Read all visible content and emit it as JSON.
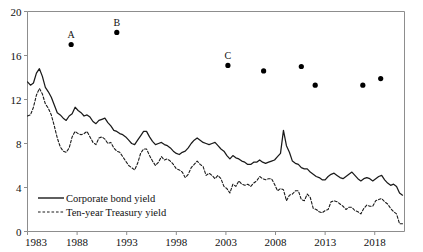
{
  "chart_data": {
    "type": "line",
    "title": "",
    "subtitle": "",
    "xlabel": "",
    "ylabel": "",
    "xlim": [
      1983,
      2021
    ],
    "ylim": [
      0,
      20
    ],
    "grid": false,
    "legend_position": "bottom-left",
    "x_ticks": [
      "1983",
      "1988",
      "1993",
      "1998",
      "2003",
      "2008",
      "2013",
      "2018"
    ],
    "x_tick_values": [
      1983,
      1988,
      1993,
      1998,
      2003,
      2008,
      2013,
      2018
    ],
    "y_ticks": [
      "0",
      "4",
      "8",
      "12",
      "16",
      "20"
    ],
    "y_tick_values": [
      0,
      4,
      8,
      12,
      16,
      20
    ],
    "legend": [
      {
        "name": "Corporate bond yield",
        "style": "solid"
      },
      {
        "name": "Ten-year Treasury yield",
        "style": "dashed"
      }
    ],
    "series": [
      {
        "name": "Corporate bond yield",
        "style": "solid",
        "x": [
          1983.0,
          1983.3,
          1983.6,
          1983.9,
          1984.2,
          1984.5,
          1984.8,
          1985.1,
          1985.4,
          1985.7,
          1986.0,
          1986.3,
          1986.6,
          1986.9,
          1987.2,
          1987.5,
          1987.8,
          1988.1,
          1988.4,
          1988.7,
          1989.0,
          1989.3,
          1989.6,
          1989.9,
          1990.2,
          1990.5,
          1990.8,
          1991.1,
          1991.4,
          1991.7,
          1992.0,
          1992.3,
          1992.6,
          1992.9,
          1993.2,
          1993.5,
          1993.8,
          1994.1,
          1994.4,
          1994.7,
          1995.0,
          1995.3,
          1995.6,
          1995.9,
          1996.2,
          1996.5,
          1996.8,
          1997.1,
          1997.4,
          1997.7,
          1998.0,
          1998.3,
          1998.6,
          1998.9,
          1999.2,
          1999.5,
          1999.8,
          2000.1,
          2000.4,
          2000.7,
          2001.0,
          2001.3,
          2001.6,
          2001.9,
          2002.2,
          2002.5,
          2002.8,
          2003.1,
          2003.4,
          2003.7,
          2004.0,
          2004.3,
          2004.6,
          2004.9,
          2005.2,
          2005.5,
          2005.8,
          2006.1,
          2006.4,
          2006.7,
          2007.0,
          2007.3,
          2007.6,
          2007.9,
          2008.2,
          2008.5,
          2008.8,
          2009.1,
          2009.4,
          2009.7,
          2010.0,
          2010.3,
          2010.6,
          2010.9,
          2011.2,
          2011.5,
          2011.8,
          2012.1,
          2012.4,
          2012.7,
          2013.0,
          2013.3,
          2013.6,
          2013.9,
          2014.2,
          2014.5,
          2014.8,
          2015.1,
          2015.4,
          2015.7,
          2016.0,
          2016.3,
          2016.6,
          2016.9,
          2017.2,
          2017.5,
          2017.8,
          2018.1,
          2018.4,
          2018.7,
          2019.0,
          2019.3,
          2019.6,
          2019.9,
          2020.2,
          2020.5,
          2020.8
        ],
        "y": [
          13.6,
          13.3,
          13.5,
          14.4,
          14.8,
          14.1,
          13.1,
          12.7,
          12.2,
          11.5,
          10.8,
          10.6,
          10.3,
          10.1,
          10.5,
          10.7,
          11.3,
          11.0,
          10.8,
          10.5,
          10.6,
          10.4,
          10.0,
          9.8,
          10.1,
          10.2,
          10.3,
          9.9,
          9.6,
          9.2,
          9.1,
          8.9,
          8.8,
          8.6,
          8.3,
          8.0,
          7.9,
          8.3,
          8.7,
          9.1,
          9.1,
          8.6,
          8.2,
          7.9,
          8.0,
          8.1,
          7.9,
          7.8,
          7.6,
          7.3,
          7.1,
          7.0,
          7.2,
          7.3,
          7.6,
          8.0,
          8.3,
          8.5,
          8.3,
          8.1,
          8.0,
          7.9,
          8.0,
          8.1,
          7.8,
          7.5,
          7.3,
          6.9,
          6.6,
          6.9,
          6.7,
          6.6,
          6.4,
          6.3,
          6.1,
          6.1,
          6.3,
          6.3,
          6.5,
          6.3,
          6.2,
          6.3,
          6.4,
          6.5,
          6.8,
          7.1,
          9.2,
          7.8,
          7.2,
          6.4,
          6.2,
          6.1,
          5.8,
          5.7,
          5.7,
          5.4,
          5.2,
          5.0,
          4.9,
          4.7,
          4.7,
          5.0,
          5.2,
          5.3,
          5.1,
          4.9,
          4.8,
          5.0,
          5.2,
          5.4,
          5.1,
          4.8,
          4.6,
          4.8,
          4.9,
          4.8,
          4.6,
          4.8,
          5.0,
          5.1,
          4.7,
          4.4,
          4.2,
          4.3,
          4.1,
          3.5,
          3.3
        ]
      },
      {
        "name": "Ten-year Treasury yield",
        "style": "dashed",
        "x": [
          1983.0,
          1983.3,
          1983.6,
          1983.9,
          1984.2,
          1984.5,
          1984.8,
          1985.1,
          1985.4,
          1985.7,
          1986.0,
          1986.3,
          1986.6,
          1986.9,
          1987.2,
          1987.5,
          1987.8,
          1988.1,
          1988.4,
          1988.7,
          1989.0,
          1989.3,
          1989.6,
          1989.9,
          1990.2,
          1990.5,
          1990.8,
          1991.1,
          1991.4,
          1991.7,
          1992.0,
          1992.3,
          1992.6,
          1992.9,
          1993.2,
          1993.5,
          1993.8,
          1994.1,
          1994.4,
          1994.7,
          1995.0,
          1995.3,
          1995.6,
          1995.9,
          1996.2,
          1996.5,
          1996.8,
          1997.1,
          1997.4,
          1997.7,
          1998.0,
          1998.3,
          1998.6,
          1998.9,
          1999.2,
          1999.5,
          1999.8,
          2000.1,
          2000.4,
          2000.7,
          2001.0,
          2001.3,
          2001.6,
          2001.9,
          2002.2,
          2002.5,
          2002.8,
          2003.1,
          2003.4,
          2003.7,
          2004.0,
          2004.3,
          2004.6,
          2004.9,
          2005.2,
          2005.5,
          2005.8,
          2006.1,
          2006.4,
          2006.7,
          2007.0,
          2007.3,
          2007.6,
          2007.9,
          2008.2,
          2008.5,
          2008.8,
          2009.1,
          2009.4,
          2009.7,
          2010.0,
          2010.3,
          2010.6,
          2010.9,
          2011.2,
          2011.5,
          2011.8,
          2012.1,
          2012.4,
          2012.7,
          2013.0,
          2013.3,
          2013.6,
          2013.9,
          2014.2,
          2014.5,
          2014.8,
          2015.1,
          2015.4,
          2015.7,
          2016.0,
          2016.3,
          2016.6,
          2016.9,
          2017.2,
          2017.5,
          2017.8,
          2018.1,
          2018.4,
          2018.7,
          2019.0,
          2019.3,
          2019.6,
          2019.9,
          2020.2,
          2020.5,
          2020.8
        ],
        "y": [
          10.5,
          10.6,
          11.3,
          12.4,
          13.0,
          12.5,
          11.6,
          11.2,
          10.6,
          9.6,
          8.5,
          7.7,
          7.3,
          7.2,
          7.6,
          8.6,
          9.1,
          8.9,
          8.8,
          8.9,
          9.1,
          8.6,
          8.1,
          7.9,
          8.5,
          8.6,
          8.4,
          8.0,
          8.1,
          7.6,
          7.3,
          7.2,
          6.8,
          6.4,
          6.0,
          5.8,
          5.6,
          6.2,
          7.1,
          7.5,
          7.5,
          6.9,
          6.4,
          6.0,
          6.3,
          6.8,
          6.5,
          6.6,
          6.4,
          6.1,
          5.7,
          5.6,
          5.4,
          4.9,
          5.2,
          5.8,
          6.1,
          6.4,
          6.1,
          5.9,
          5.1,
          5.3,
          5.1,
          4.8,
          5.1,
          4.8,
          4.1,
          3.9,
          3.5,
          4.3,
          4.1,
          4.6,
          4.3,
          4.2,
          4.3,
          4.1,
          4.4,
          4.6,
          5.0,
          4.8,
          4.7,
          4.8,
          4.8,
          4.3,
          3.7,
          3.9,
          3.8,
          2.8,
          3.3,
          3.4,
          3.7,
          3.7,
          2.9,
          2.8,
          3.4,
          3.1,
          2.1,
          2.0,
          1.8,
          1.7,
          1.9,
          2.0,
          2.7,
          2.8,
          2.7,
          2.5,
          2.3,
          2.0,
          2.2,
          2.2,
          1.9,
          1.8,
          1.6,
          2.1,
          2.4,
          2.3,
          2.3,
          2.8,
          2.9,
          3.0,
          2.7,
          2.5,
          2.1,
          1.8,
          1.6,
          0.7,
          0.7
        ]
      }
    ],
    "markers": [
      {
        "label": "A",
        "x": 1987.4,
        "y": 17.0
      },
      {
        "label": "B",
        "x": 1992.0,
        "y": 18.1
      },
      {
        "label": "C",
        "x": 2003.2,
        "y": 15.1
      },
      {
        "label": "",
        "x": 2006.8,
        "y": 14.6
      },
      {
        "label": "",
        "x": 2010.6,
        "y": 15.0
      },
      {
        "label": "",
        "x": 2012.0,
        "y": 13.3
      },
      {
        "label": "",
        "x": 2016.8,
        "y": 13.3
      },
      {
        "label": "",
        "x": 2018.6,
        "y": 13.9
      }
    ]
  }
}
